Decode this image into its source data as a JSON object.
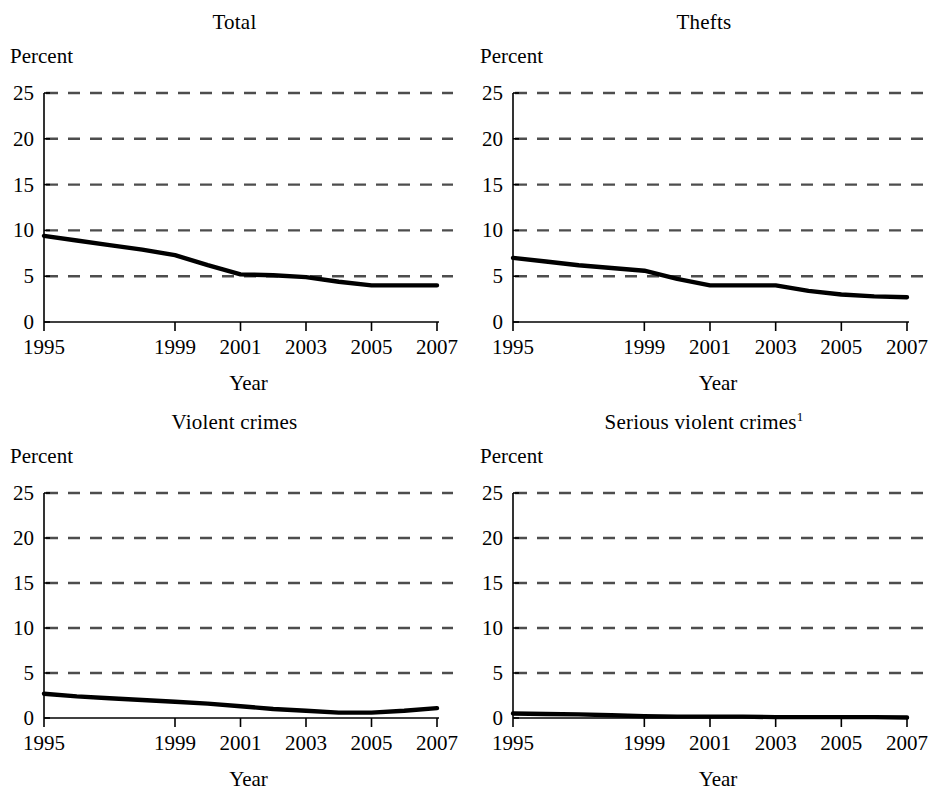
{
  "figure": {
    "background": "#ffffff",
    "ink": "#000000",
    "series_color": "#000000",
    "grid_color": "#4d4d4d"
  },
  "common": {
    "y_axis_unit_label": "Percent",
    "x_axis_label": "Year",
    "y_ticks": [
      0,
      5,
      10,
      15,
      20,
      25
    ],
    "y_tick_labels": [
      "0",
      "5",
      "10",
      "15",
      "20",
      "25"
    ],
    "x_ticks": [
      1995,
      1999,
      2001,
      2003,
      2005,
      2007
    ],
    "x_tick_labels": [
      "1995",
      "1999",
      "2001",
      "2003",
      "2005",
      "2007"
    ],
    "ylim": [
      0,
      25
    ],
    "xlim": [
      1995,
      2007
    ],
    "grid": "horizontal-dashed",
    "legend": "none"
  },
  "chart_data": [
    {
      "type": "line",
      "title": "Total",
      "title_superscript": "",
      "xlabel": "Year",
      "ylabel": "Percent",
      "ylim": [
        0,
        25
      ],
      "xlim": [
        1995,
        2007
      ],
      "x": [
        1995,
        1996,
        1997,
        1998,
        1999,
        2000,
        2001,
        2002,
        2003,
        2004,
        2005,
        2006,
        2007
      ],
      "values": [
        9.4,
        8.9,
        8.4,
        7.9,
        7.3,
        6.2,
        5.2,
        5.1,
        4.9,
        4.4,
        4.0,
        4.0,
        4.0
      ],
      "categories": [
        "1995",
        "1996",
        "1997",
        "1998",
        "1999",
        "2000",
        "2001",
        "2002",
        "2003",
        "2004",
        "2005",
        "2006",
        "2007"
      ]
    },
    {
      "type": "line",
      "title": "Thefts",
      "title_superscript": "",
      "xlabel": "Year",
      "ylabel": "Percent",
      "ylim": [
        0,
        25
      ],
      "xlim": [
        1995,
        2007
      ],
      "x": [
        1995,
        1996,
        1997,
        1998,
        1999,
        2000,
        2001,
        2002,
        2003,
        2004,
        2005,
        2006,
        2007
      ],
      "values": [
        7.0,
        6.6,
        6.2,
        5.9,
        5.6,
        4.7,
        4.0,
        4.0,
        4.0,
        3.4,
        3.0,
        2.8,
        2.7
      ],
      "categories": [
        "1995",
        "1996",
        "1997",
        "1998",
        "1999",
        "2000",
        "2001",
        "2002",
        "2003",
        "2004",
        "2005",
        "2006",
        "2007"
      ]
    },
    {
      "type": "line",
      "title": "Violent crimes",
      "title_superscript": "",
      "xlabel": "Year",
      "ylabel": "Percent",
      "ylim": [
        0,
        25
      ],
      "xlim": [
        1995,
        2007
      ],
      "x": [
        1995,
        1996,
        1997,
        1998,
        1999,
        2000,
        2001,
        2002,
        2003,
        2004,
        2005,
        2006,
        2007
      ],
      "values": [
        2.7,
        2.4,
        2.2,
        2.0,
        1.8,
        1.6,
        1.3,
        1.0,
        0.8,
        0.6,
        0.6,
        0.8,
        1.1
      ],
      "categories": [
        "1995",
        "1996",
        "1997",
        "1998",
        "1999",
        "2000",
        "2001",
        "2002",
        "2003",
        "2004",
        "2005",
        "2006",
        "2007"
      ]
    },
    {
      "type": "line",
      "title": "Serious violent crimes",
      "title_superscript": "1",
      "xlabel": "Year",
      "ylabel": "Percent",
      "ylim": [
        0,
        25
      ],
      "xlim": [
        1995,
        2007
      ],
      "x": [
        1995,
        1996,
        1997,
        1998,
        1999,
        2000,
        2001,
        2002,
        2003,
        2004,
        2005,
        2006,
        2007
      ],
      "values": [
        0.5,
        0.45,
        0.4,
        0.3,
        0.2,
        0.15,
        0.15,
        0.15,
        0.1,
        0.1,
        0.1,
        0.1,
        0.05
      ],
      "categories": [
        "1995",
        "1996",
        "1997",
        "1998",
        "1999",
        "2000",
        "2001",
        "2002",
        "2003",
        "2004",
        "2005",
        "2006",
        "2007"
      ]
    }
  ]
}
